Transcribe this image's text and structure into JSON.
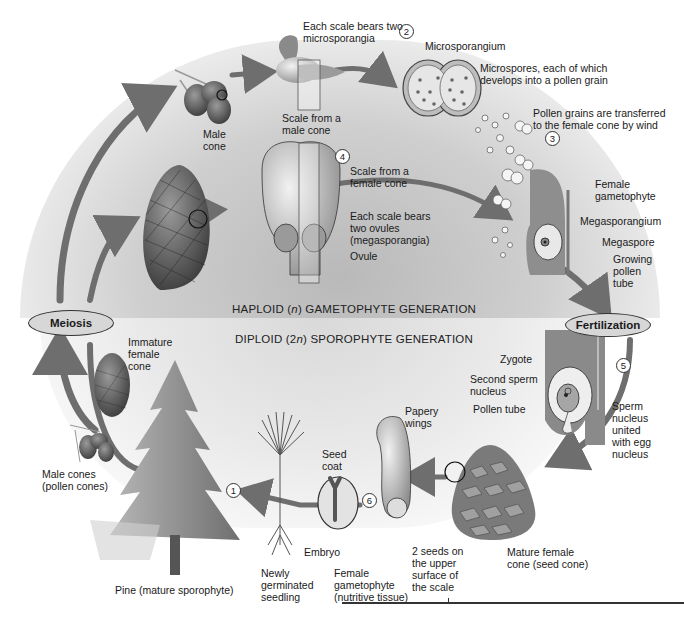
{
  "diagram": {
    "generations": {
      "haploid": {
        "prefix": "HAPLOID (",
        "italic": "n",
        "suffix": ") GAMETOPHYTE GENERATION"
      },
      "diploid": {
        "prefix": "DIPLOID (2",
        "italic": "n",
        "suffix": ") SPOROPHYTE GENERATION"
      }
    },
    "process_ovals": {
      "meiosis": "Meiosis",
      "fertilization": "Fertilization"
    },
    "steps": [
      "1",
      "2",
      "3",
      "4",
      "5",
      "6"
    ],
    "labels": {
      "male_cone": "Male\ncone",
      "scale_bears_microsporangia": "Each scale bears two\nmicrosporangia",
      "scale_from_male_cone": "Scale from a\nmale cone",
      "microsporangium": "Microsporangium",
      "microspores": "Microspores, each of which\ndevelops into a pollen grain",
      "pollen_transferred": "Pollen grains are transferred\nto the female cone by wind",
      "female_gametophyte": "Female\ngametophyte",
      "megasporangium": "Megasporangium",
      "megaspore": "Megaspore",
      "growing_pollen_tube": "Growing\npollen\ntube",
      "scale_from_female_cone": "Scale from a\nfemale cone",
      "scale_bears_ovules": "Each scale bears\ntwo ovules\n(megasporangia)",
      "ovule": "Ovule",
      "immature_female_cone": "Immature\nfemale\ncone",
      "male_cones_pollen": "Male cones\n(pollen cones)",
      "pine_sporophyte": "Pine (mature sporophyte)",
      "zygote": "Zygote",
      "second_sperm_nucleus": "Second sperm\nnucleus",
      "pollen_tube": "Pollen tube",
      "sperm_united": "Sperm\nnucleus\nunited\nwith egg\nnucleus",
      "papery_wings": "Papery\nwings",
      "seed_coat": "Seed\ncoat",
      "embryo": "Embryo",
      "newly_germinated_seedling": "Newly\ngerminated\nseedling",
      "female_gametophyte_nutritive": "Female\ngametophyte\n(nutritive tissue)",
      "two_seeds": "2 seeds on\nthe upper\nsurface of\nthe scale",
      "mature_female_cone": "Mature female\ncone (seed cone)"
    },
    "colors": {
      "arrow": "#6e6e6e",
      "haploid_bg": "#c9c9c9",
      "diploid_bg": "#e6e6e6",
      "oval_fill": "#d7d7d7"
    }
  }
}
